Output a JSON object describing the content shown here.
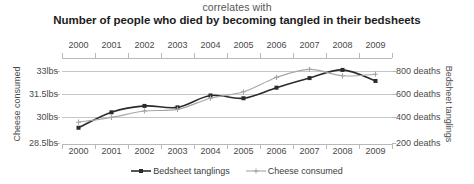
{
  "header": {
    "correlates_with": "correlates with",
    "headline": "Number of people who died by becoming tangled in their bedsheets"
  },
  "legend": {
    "items": [
      {
        "label": "Bedsheet tanglings",
        "color": "#2b2b2b",
        "marker": "square"
      },
      {
        "label": "Cheese consumed",
        "color": "#a6a6a6",
        "marker": "plus"
      }
    ]
  },
  "axes": {
    "left_title": "Cheese consumed",
    "right_title": "Bedsheet tanglings",
    "left_ticks": [
      "33lbs",
      "31.5lbs",
      "30lbs",
      "28.5lbs"
    ],
    "right_ticks": [
      "800 deaths",
      "600 deaths",
      "400 deaths",
      "200 deaths"
    ],
    "years": [
      "2000",
      "2001",
      "2002",
      "2003",
      "2004",
      "2005",
      "2006",
      "2007",
      "2008",
      "2009"
    ]
  },
  "chart_data": {
    "type": "line",
    "title": "Number of people who died by becoming tangled in their bedsheets",
    "subtitle": "correlates with",
    "x": [
      2000,
      2001,
      2002,
      2003,
      2004,
      2005,
      2006,
      2007,
      2008,
      2009
    ],
    "xlabel": "",
    "grid": true,
    "legend_position": "bottom",
    "series": [
      {
        "name": "Bedsheet tanglings",
        "axis": "right",
        "ylabel": "Bedsheet tanglings",
        "unit": "deaths",
        "ylim": [
          200,
          900
        ],
        "yticks": [
          200,
          400,
          600,
          800
        ],
        "color": "#2b2b2b",
        "marker": "square",
        "values": [
          327,
          456,
          509,
          497,
          596,
          573,
          661,
          741,
          809,
          717
        ]
      },
      {
        "name": "Cheese consumed",
        "axis": "left",
        "ylabel": "Cheese consumed",
        "unit": "lbs",
        "ylim": [
          28.5,
          33.75
        ],
        "yticks": [
          28.5,
          30,
          31.5,
          33
        ],
        "color": "#a6a6a6",
        "marker": "plus",
        "values": [
          29.8,
          30.1,
          30.5,
          30.6,
          31.3,
          31.7,
          32.6,
          33.1,
          32.7,
          32.8
        ]
      }
    ]
  }
}
